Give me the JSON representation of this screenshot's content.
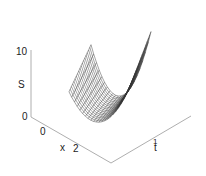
{
  "chart_data": {
    "type": "surface",
    "title": "",
    "zlabel": "S",
    "xlabel": "x",
    "ylabel": "t",
    "zticks": [
      "0",
      "10"
    ],
    "xticks": [
      "0",
      "2"
    ],
    "tticks": [
      "1"
    ],
    "zlim": [
      0,
      10
    ],
    "grid": false,
    "legend": null
  },
  "labels": {
    "z_top": "10",
    "z_bottom": "0",
    "z_name": "S",
    "x_zero": "0",
    "x_two": "2",
    "x_name": "x",
    "t_name": "t",
    "t_tick": "1"
  },
  "colors": {
    "axis": "#888888",
    "mesh": "#333333",
    "text": "#222222"
  }
}
